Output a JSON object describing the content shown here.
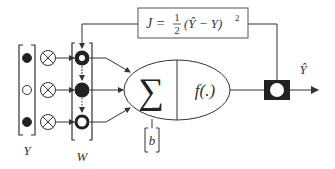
{
  "diagram": {
    "input_vector_label": "Y",
    "weight_vector_label": "W",
    "bias_label": "b",
    "sum_symbol": "∑",
    "activation_label": "f(.)",
    "output_label": "Ŷ",
    "cost_function": {
      "lhs": "J =",
      "frac_num": "1",
      "frac_den": "2",
      "rhs": "(Ŷ − Y)",
      "exponent": "2"
    },
    "inputs": [
      {
        "state": "filled"
      },
      {
        "state": "empty"
      },
      {
        "state": "filled"
      }
    ],
    "weights": [
      {
        "state": "ring"
      },
      {
        "state": "filled"
      },
      {
        "state": "ring"
      }
    ],
    "colors": {
      "stroke": "#333333",
      "fill_dark": "#222222",
      "background": "#ffffff"
    }
  }
}
